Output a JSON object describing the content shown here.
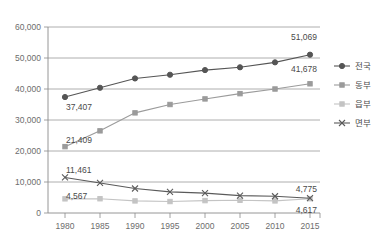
{
  "chart_data": {
    "type": "line",
    "title": "",
    "subtitle": "",
    "xlabel": "",
    "ylabel": "",
    "categories": [
      "1980",
      "1985",
      "1990",
      "1995",
      "2000",
      "2005",
      "2010",
      "2015"
    ],
    "ylim": [
      0,
      60000
    ],
    "ytick_labels": [
      "0",
      "10,000",
      "20,000",
      "30,000",
      "40,000",
      "50,000",
      "60,000"
    ],
    "ytick_values": [
      0,
      10000,
      20000,
      30000,
      40000,
      50000,
      60000
    ],
    "grid": true,
    "legend_position": "right",
    "series": [
      {
        "name": "전국",
        "marker": "filled-circle",
        "color": "#555555",
        "values": [
          37407,
          40400,
          43400,
          44600,
          46100,
          47000,
          48600,
          51069
        ],
        "labels": [
          {
            "index": 0,
            "text": "37,407"
          },
          {
            "index": 7,
            "text": "51,069"
          }
        ]
      },
      {
        "name": "동부",
        "marker": "filled-square",
        "color": "#9b9b9b",
        "values": [
          21409,
          26500,
          32300,
          35000,
          36800,
          38500,
          40000,
          41678
        ],
        "labels": [
          {
            "index": 0,
            "text": "21,409"
          },
          {
            "index": 7,
            "text": "41,678"
          }
        ]
      },
      {
        "name": "읍부",
        "marker": "light-square",
        "color": "#c4c4c4",
        "values": [
          4567,
          4600,
          3900,
          3700,
          4000,
          4100,
          3900,
          4617
        ],
        "labels": [
          {
            "index": 0,
            "text": "4,567"
          },
          {
            "index": 7,
            "text": "4,617"
          }
        ]
      },
      {
        "name": "면부",
        "marker": "x-cross",
        "color": "#5a5a5a",
        "values": [
          11461,
          9700,
          7900,
          6800,
          6400,
          5600,
          5400,
          4775
        ],
        "labels": [
          {
            "index": 0,
            "text": "11,461"
          },
          {
            "index": 7,
            "text": "4,775"
          }
        ]
      }
    ]
  },
  "legend": {
    "items": [
      {
        "label": "전국",
        "marker": "filled-circle",
        "color": "#555555"
      },
      {
        "label": "동부",
        "marker": "filled-square",
        "color": "#9b9b9b"
      },
      {
        "label": "읍부",
        "marker": "light-square",
        "color": "#c4c4c4"
      },
      {
        "label": "면부",
        "marker": "x-cross",
        "color": "#5a5a5a"
      }
    ]
  },
  "yaxis": {
    "t0": "0",
    "t1": "10,000",
    "t2": "20,000",
    "t3": "30,000",
    "t4": "40,000",
    "t5": "50,000",
    "t6": "60,000"
  },
  "xaxis": {
    "t0": "1980",
    "t1": "1985",
    "t2": "1990",
    "t3": "1995",
    "t4": "2000",
    "t5": "2005",
    "t6": "2010",
    "t7": "2015"
  },
  "point_labels": {
    "nationwide_first": "37,407",
    "nationwide_last": "51,069",
    "dong_first": "21,409",
    "dong_last": "41,678",
    "eup_first": "4,567",
    "eup_last": "4,617",
    "myeon_first": "11,461",
    "myeon_last": "4,775"
  }
}
